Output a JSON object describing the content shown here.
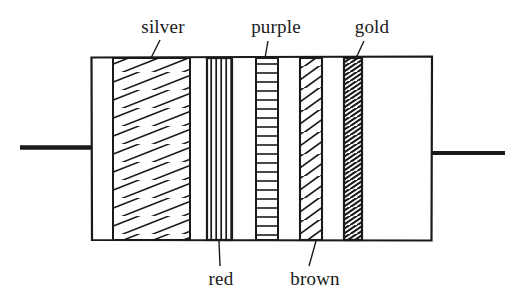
{
  "figure": {
    "type": "line-drawing",
    "background_color": "#ffffff",
    "ink_color": "#1a1a1a"
  },
  "component": {
    "name": "resistor",
    "body": {
      "left": 91,
      "right": 432,
      "top": 57,
      "bottom": 240
    },
    "leads": [
      {
        "name": "left-lead",
        "x1": 20,
        "x2": 92,
        "y": 147
      },
      {
        "name": "right-lead",
        "x1": 431,
        "x2": 505,
        "y": 153
      }
    ]
  },
  "bands": [
    {
      "id": "silver",
      "label": "silver",
      "hatch": "diagonal-wide",
      "left": 113,
      "right": 190,
      "label_position": "top",
      "label_x": 163,
      "label_y": 33,
      "leader": {
        "x1": 160,
        "y1": 40,
        "x2": 152,
        "y2": 58
      }
    },
    {
      "id": "red",
      "label": "red",
      "hatch": "vertical-lines",
      "left": 207,
      "right": 232,
      "label_position": "bottom",
      "label_x": 221,
      "label_y": 282,
      "leader": {
        "x1": 220,
        "y1": 265,
        "x2": 219,
        "y2": 241
      }
    },
    {
      "id": "purple",
      "label": "purple",
      "hatch": "horizontal-ladder",
      "left": 256,
      "right": 278,
      "label_position": "top",
      "label_x": 274,
      "label_y": 33,
      "leader": {
        "x1": 268,
        "y1": 40,
        "x2": 265,
        "y2": 58
      }
    },
    {
      "id": "brown",
      "label": "brown",
      "hatch": "diagonal-medium",
      "left": 300,
      "right": 322,
      "label_position": "bottom",
      "label_x": 314,
      "label_y": 282,
      "leader": {
        "x1": 310,
        "y1": 265,
        "x2": 315,
        "y2": 241
      }
    },
    {
      "id": "gold",
      "label": "gold",
      "hatch": "diagonal-dense",
      "left": 344,
      "right": 362,
      "label_position": "top",
      "label_x": 367,
      "label_y": 33,
      "leader": {
        "x1": 363,
        "y1": 40,
        "x2": 357,
        "y2": 58
      }
    }
  ]
}
